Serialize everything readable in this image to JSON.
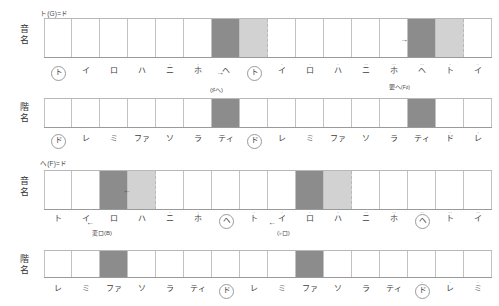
{
  "diagrams": [
    {
      "id": "g-major",
      "key_label": "ト(G)=ド",
      "rows": [
        {
          "id": "note-names",
          "row_label_line1": "音",
          "row_label_line2": "名",
          "labels": [
            {
              "text": "ト",
              "dots": "",
              "circled": true
            },
            {
              "text": "イ",
              "dots": "",
              "circled": false
            },
            {
              "text": "ロ",
              "dots": "",
              "circled": false
            },
            {
              "text": "ハ",
              "dots": "",
              "circled": false
            },
            {
              "text": "ニ",
              "dots": "·",
              "circled": false
            },
            {
              "text": "ホ",
              "dots": "·",
              "circled": false
            },
            {
              "text": "ヘ",
              "dots": "",
              "circled": false
            },
            {
              "text": "ト",
              "dots": "",
              "circled": true
            },
            {
              "text": "イ",
              "dots": "·",
              "circled": false
            },
            {
              "text": "ロ",
              "dots": "·",
              "circled": false
            },
            {
              "text": "ハ",
              "dots": "·",
              "circled": false
            },
            {
              "text": "ニ",
              "dots": "··",
              "circled": false
            },
            {
              "text": "ホ",
              "dots": "··",
              "circled": false
            },
            {
              "text": "ヘ",
              "dots": "··",
              "circled": false
            },
            {
              "text": "ト",
              "dots": "·",
              "circled": false
            },
            {
              "text": "イ",
              "dots": "·",
              "circled": false
            }
          ],
          "annotations": [
            {
              "text": "(♯ヘ)",
              "small": "",
              "x": 210,
              "y": 85
            },
            {
              "text": "嬰ヘ",
              "small": "(F♯)",
              "x": 389,
              "y": 82
            }
          ],
          "arrows": [
            {
              "glyph": "→",
              "x": 216,
              "y": 68
            },
            {
              "glyph": "→",
              "x": 400,
              "y": 35
            }
          ],
          "shaded": [
            {
              "index": 6,
              "type": "dark"
            },
            {
              "index": 7,
              "type": "light"
            },
            {
              "index": 13,
              "type": "dark"
            },
            {
              "index": 14,
              "type": "light"
            }
          ]
        },
        {
          "id": "scale-degrees",
          "row_label_line1": "階",
          "row_label_line2": "名",
          "labels": [
            {
              "text": "ド",
              "dots": "",
              "circled": true
            },
            {
              "text": "レ",
              "dots": "",
              "circled": false
            },
            {
              "text": "ミ",
              "dots": "",
              "circled": false
            },
            {
              "text": "ファ",
              "dots": "",
              "circled": false
            },
            {
              "text": "ソ",
              "dots": "",
              "circled": false
            },
            {
              "text": "ラ",
              "dots": "",
              "circled": false
            },
            {
              "text": "ティ",
              "dots": "",
              "circled": false
            },
            {
              "text": "ド",
              "dots": "",
              "circled": true
            },
            {
              "text": "レ",
              "dots": "",
              "circled": false
            },
            {
              "text": "ミ",
              "dots": "",
              "circled": false
            },
            {
              "text": "ファ",
              "dots": "",
              "circled": false
            },
            {
              "text": "ソ",
              "dots": "",
              "circled": false
            },
            {
              "text": "ラ",
              "dots": "",
              "circled": false
            },
            {
              "text": "ティ",
              "dots": "",
              "circled": false
            },
            {
              "text": "ド",
              "dots": "·",
              "circled": false
            },
            {
              "text": "レ",
              "dots": "·",
              "circled": false
            }
          ],
          "annotations": [],
          "arrows": [],
          "shaded": [
            {
              "index": 6,
              "type": "dark"
            },
            {
              "index": 13,
              "type": "dark"
            }
          ]
        }
      ]
    },
    {
      "id": "f-major",
      "key_label": "ヘ(F)=ド",
      "rows": [
        {
          "id": "note-names",
          "row_label_line1": "音",
          "row_label_line2": "名",
          "labels": [
            {
              "text": "ト",
              "dots": "",
              "circled": false
            },
            {
              "text": "イ",
              "dots": "",
              "circled": false
            },
            {
              "text": "ロ",
              "dots": "",
              "circled": false
            },
            {
              "text": "ハ",
              "dots": "",
              "circled": false
            },
            {
              "text": "ニ",
              "dots": "·",
              "circled": false
            },
            {
              "text": "ホ",
              "dots": "·",
              "circled": false
            },
            {
              "text": "ヘ",
              "dots": "",
              "circled": true
            },
            {
              "text": "ト",
              "dots": "·",
              "circled": false
            },
            {
              "text": "イ",
              "dots": "·",
              "circled": false
            },
            {
              "text": "ロ",
              "dots": "·",
              "circled": false
            },
            {
              "text": "ハ",
              "dots": "·",
              "circled": false
            },
            {
              "text": "ニ",
              "dots": "··",
              "circled": false
            },
            {
              "text": "ホ",
              "dots": "··",
              "circled": false
            },
            {
              "text": "ヘ",
              "dots": "··",
              "circled": true
            },
            {
              "text": "ト",
              "dots": "··",
              "circled": false
            },
            {
              "text": "イ",
              "dots": "··",
              "circled": false
            }
          ],
          "annotations": [
            {
              "text": "変ロ(B)",
              "small": "",
              "x": 92,
              "y": 228
            },
            {
              "text": "(♭ロ)",
              "small": "",
              "x": 277,
              "y": 228
            }
          ],
          "arrows": [
            {
              "glyph": "←",
              "x": 86,
              "y": 218
            },
            {
              "glyph": "←",
              "x": 268,
              "y": 218
            },
            {
              "glyph": "←",
              "x": 123,
              "y": 186
            }
          ],
          "shaded": [
            {
              "index": 2,
              "type": "dark"
            },
            {
              "index": 3,
              "type": "light"
            },
            {
              "index": 9,
              "type": "dark"
            },
            {
              "index": 10,
              "type": "light"
            }
          ]
        },
        {
          "id": "scale-degrees",
          "row_label_line1": "階",
          "row_label_line2": "名",
          "labels": [
            {
              "text": "レ",
              "dots": "",
              "circled": false
            },
            {
              "text": "ミ",
              "dots": "",
              "circled": false
            },
            {
              "text": "ファ",
              "dots": "",
              "circled": false
            },
            {
              "text": "ソ",
              "dots": "",
              "circled": false
            },
            {
              "text": "ラ",
              "dots": "",
              "circled": false
            },
            {
              "text": "ティ",
              "dots": "",
              "circled": false
            },
            {
              "text": "ド",
              "dots": "",
              "circled": true
            },
            {
              "text": "レ",
              "dots": "",
              "circled": false
            },
            {
              "text": "ミ",
              "dots": "",
              "circled": false
            },
            {
              "text": "ファ",
              "dots": "",
              "circled": false
            },
            {
              "text": "ソ",
              "dots": "",
              "circled": false
            },
            {
              "text": "ラ",
              "dots": "",
              "circled": false
            },
            {
              "text": "ティ",
              "dots": "",
              "circled": false
            },
            {
              "text": "ド",
              "dots": "·",
              "circled": true
            },
            {
              "text": "レ",
              "dots": "·",
              "circled": false
            },
            {
              "text": "ミ",
              "dots": "·",
              "circled": false
            }
          ],
          "annotations": [],
          "arrows": [],
          "shaded": [
            {
              "index": 2,
              "type": "dark"
            },
            {
              "index": 9,
              "type": "dark"
            }
          ]
        }
      ]
    }
  ],
  "colors": {
    "shade_dark": "#8c8c8c",
    "shade_light": "#d2d2d2",
    "grid_line": "#c2c2c2",
    "text": "#3d3d3d"
  }
}
